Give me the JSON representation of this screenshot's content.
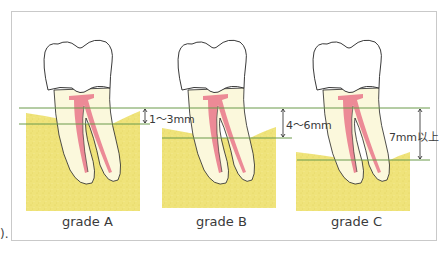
{
  "edge_fragment": ").",
  "panels": [
    {
      "grade": "grade A",
      "measurement": "1～3mm"
    },
    {
      "grade": "grade B",
      "measurement": "4～6mm"
    },
    {
      "grade": "grade C",
      "measurement": "7mm以上"
    }
  ],
  "colors": {
    "bone": "#efe37a",
    "bone_dark": "#e6d85f",
    "green_line": "#6a9a4a",
    "pulp": "#ec8a96",
    "root_fill": "#fbf8dc",
    "outline": "#222222",
    "frame": "#c9c9c9"
  }
}
